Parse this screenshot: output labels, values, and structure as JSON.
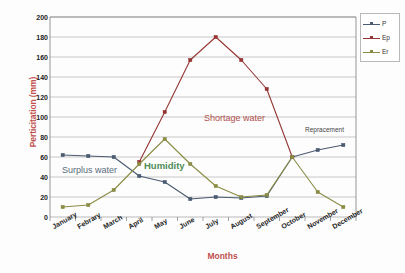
{
  "chart_data": {
    "type": "line",
    "title": "",
    "xlabel": "Months",
    "ylabel": "Perticitation (mm)",
    "ylim": [
      0,
      200
    ],
    "ytick_step": 20,
    "yticks": [
      200,
      180,
      160,
      140,
      120,
      100,
      80,
      60,
      40,
      20,
      0
    ],
    "grid": true,
    "legend_position": "top-right",
    "categories": [
      "January",
      "Febrary",
      "March",
      "April",
      "May",
      "June",
      "July",
      "August",
      "September",
      "October",
      "November",
      "December"
    ],
    "series": [
      {
        "name": "P",
        "color": "#4a5a70",
        "values": [
          62,
          61,
          60,
          41,
          35,
          18,
          20,
          19,
          21,
          60,
          67,
          72
        ]
      },
      {
        "name": "Ep",
        "color": "#943634",
        "values": [
          null,
          null,
          null,
          55,
          105,
          157,
          180,
          157,
          128,
          60,
          null,
          null
        ]
      },
      {
        "name": "Er",
        "color": "#8a8c45",
        "values": [
          10,
          12,
          27,
          53,
          78,
          53,
          31,
          20,
          22,
          60,
          25,
          10
        ]
      }
    ],
    "annotations": [
      {
        "text": "Surplus water",
        "color": "#5a6b7b"
      },
      {
        "text": "Humidity",
        "color": "#4d8c57"
      },
      {
        "text": "Shortage water",
        "color": "#b0504d"
      },
      {
        "text": "Repracement",
        "color": "#444444"
      }
    ]
  },
  "legend": {
    "items": [
      {
        "label": "P"
      },
      {
        "label": "Ep"
      },
      {
        "label": "Er"
      }
    ]
  }
}
